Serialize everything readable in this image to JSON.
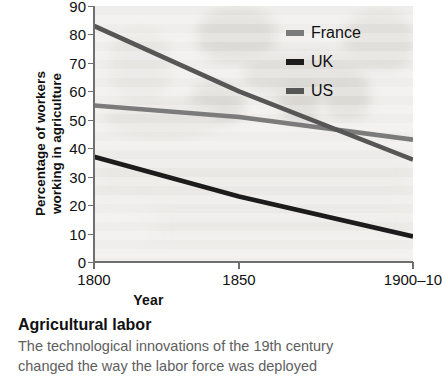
{
  "chart_data": {
    "type": "line",
    "title": "",
    "xlabel": "Year",
    "ylabel": "Percentage of workers working in agriculture",
    "ylabel_line1": "Percentage of workers",
    "ylabel_line2": "working in agriculture",
    "x": [
      1800,
      1850,
      1910
    ],
    "xticklabels": [
      "1800",
      "1850",
      "1900–10"
    ],
    "yticklabels": [
      "0",
      "10",
      "20",
      "30",
      "40",
      "50",
      "60",
      "70",
      "80",
      "90"
    ],
    "yticks": [
      0,
      10,
      20,
      30,
      40,
      50,
      60,
      70,
      80,
      90
    ],
    "xlim": [
      1800,
      1910
    ],
    "ylim": [
      0,
      90
    ],
    "grid": false,
    "legend_position": "top-right",
    "series": [
      {
        "name": "France",
        "color": "#7b7b7b",
        "values": [
          55,
          51,
          43
        ]
      },
      {
        "name": "UK",
        "color": "#1c1c1c",
        "values": [
          37,
          23,
          9
        ]
      },
      {
        "name": "US",
        "color": "#565656",
        "values": [
          83,
          60,
          36
        ]
      }
    ]
  },
  "legend": {
    "items": [
      {
        "label": "France",
        "color": "#7b7b7b"
      },
      {
        "label": "UK",
        "color": "#1c1c1c"
      },
      {
        "label": "US",
        "color": "#565656"
      }
    ]
  },
  "axes": {
    "x_title": "Year",
    "y_title_line1": "Percentage of workers",
    "y_title_line2": "working in agriculture",
    "x_tick_labels": [
      "1800",
      "1850",
      "1900–10"
    ],
    "y_tick_labels": [
      "90",
      "80",
      "70",
      "60",
      "50",
      "40",
      "30",
      "20",
      "10",
      "0"
    ]
  },
  "caption": {
    "title": "Agricultural labor",
    "body_line1": "The technological innovations of the 19th century",
    "body_line2": "changed the way the labor force was deployed"
  },
  "colors": {
    "plot_background": "#efeeec",
    "axis": "#6f6f6f",
    "text": "#111111",
    "caption_body": "#5e5e5e"
  }
}
